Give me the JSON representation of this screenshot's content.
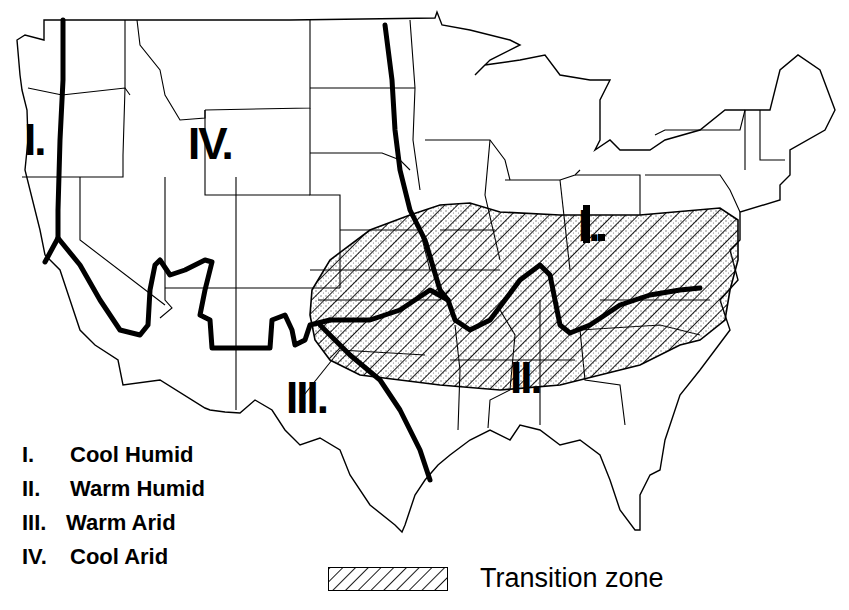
{
  "zones": [
    {
      "id": "I",
      "label": "I.",
      "name": "Cool Humid",
      "x": 24,
      "y": 118
    },
    {
      "id": "I-east",
      "label": "I.",
      "name": "Cool Humid",
      "x": 578,
      "y": 204
    },
    {
      "id": "II",
      "label": "II.",
      "name": "Warm Humid",
      "x": 512,
      "y": 356
    },
    {
      "id": "III",
      "label": "III.",
      "name": "Warm Arid",
      "x": 288,
      "y": 376
    },
    {
      "id": "IV",
      "label": "IV.",
      "name": "Cool Arid",
      "x": 188,
      "y": 122
    }
  ],
  "legend": {
    "items": [
      {
        "num": "I.",
        "text": "Cool Humid"
      },
      {
        "num": "II.",
        "text": "Warm Humid"
      },
      {
        "num": "III.",
        "text": "Warm Arid"
      },
      {
        "num": "IV.",
        "text": "Cool Arid"
      }
    ],
    "transition_label": "Transition zone"
  },
  "colors": {
    "ink": "#000000",
    "background": "#ffffff",
    "stipple": "#555555"
  }
}
